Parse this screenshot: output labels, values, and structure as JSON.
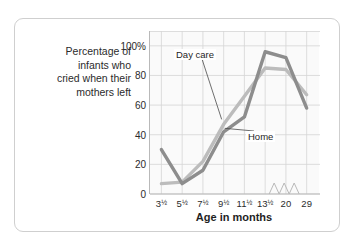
{
  "chart_data": {
    "type": "line",
    "title": "",
    "ylabel": "Percentage of infants who cried when their mothers left",
    "ylabel_lines": [
      "Percentage of",
      "infants who",
      "cried when their",
      "mothers left"
    ],
    "xlabel": "Age in months",
    "categories": [
      "3½",
      "5½",
      "7½",
      "9½",
      "11½",
      "13½",
      "20",
      "29"
    ],
    "x_tick_labels": [
      {
        "whole": "3",
        "frac": "½"
      },
      {
        "whole": "5",
        "frac": "½"
      },
      {
        "whole": "7",
        "frac": "½"
      },
      {
        "whole": "9",
        "frac": "½"
      },
      {
        "whole": "11",
        "frac": "½"
      },
      {
        "whole": "13",
        "frac": "½"
      },
      {
        "whole": "20",
        "frac": ""
      },
      {
        "whole": "29",
        "frac": ""
      }
    ],
    "y_tick_labels": [
      "100%",
      "80",
      "60",
      "40",
      "20",
      "0"
    ],
    "y_tick_values": [
      100,
      80,
      60,
      40,
      20,
      0
    ],
    "ylim": [
      0,
      110
    ],
    "grid": true,
    "legend_position": "inline-callouts",
    "axis_break": true,
    "series": [
      {
        "name": "Home",
        "color": "#8d8d8d",
        "values": [
          30,
          7,
          16,
          42,
          52,
          96,
          92,
          58
        ]
      },
      {
        "name": "Day care",
        "color": "#bcbcbc",
        "values": [
          7,
          8,
          22,
          47,
          66,
          85,
          84,
          67
        ]
      }
    ],
    "annotations": [
      {
        "name": "Day care",
        "target_series": "Day care",
        "target_index": 3
      },
      {
        "name": "Home",
        "target_series": "Home",
        "target_index": 3
      }
    ]
  },
  "colors": {
    "home_line": "#8d8d8d",
    "daycare_line": "#bcbcbc",
    "grid": "#d6d6d6",
    "axis": "#b9b9b9",
    "plot_background": "#fafafa",
    "card_border": "#cfcfcf",
    "text": "#2b2b2b"
  }
}
